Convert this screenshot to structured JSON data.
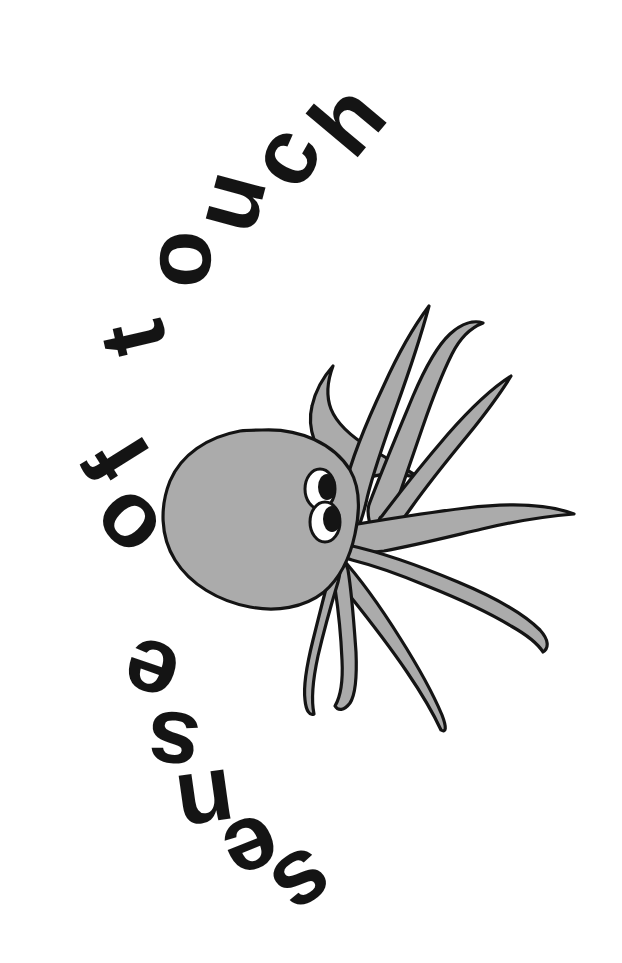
{
  "page": {
    "title": "sense of touch",
    "background_color": "#ffffff",
    "width": 622,
    "height": 963,
    "kind": "illustration-worksheet"
  },
  "curved_title": {
    "full_text": "sense of touch",
    "word_1": "sense",
    "word_2": "of",
    "word_3": "touch",
    "color": "#141414",
    "arc_direction": "counter-clockwise",
    "start_position": "bottom-right",
    "end_position": "top-right",
    "letters": [
      {
        "char": "s",
        "x": 302,
        "y": 886,
        "rotate": 146
      },
      {
        "char": "e",
        "x": 250,
        "y": 852,
        "rotate": 158
      },
      {
        "char": "n",
        "x": 203,
        "y": 805,
        "rotate": 172
      },
      {
        "char": "s",
        "x": 170,
        "y": 745,
        "rotate": 186
      },
      {
        "char": "e",
        "x": 147,
        "y": 673,
        "rotate": 199
      },
      {
        "char": "o",
        "x": 122,
        "y": 524,
        "rotate": 226
      },
      {
        "char": "f",
        "x": 116,
        "y": 457,
        "rotate": 238
      },
      {
        "char": "t",
        "x": 132,
        "y": 336,
        "rotate": 257
      },
      {
        "char": "o",
        "x": 178,
        "y": 256,
        "rotate": 272
      },
      {
        "char": "u",
        "x": 229,
        "y": 198,
        "rotate": 285
      },
      {
        "char": "c",
        "x": 285,
        "y": 153,
        "rotate": 297
      },
      {
        "char": "h",
        "x": 349,
        "y": 117,
        "rotate": 310
      }
    ]
  },
  "octopus": {
    "name": "octopus",
    "body_fill": "#ababab",
    "outline_color": "#141414",
    "outline_width": 3,
    "eye_white": "#ffffff",
    "eye_pupil": "#141414",
    "tentacle_count": 7,
    "body_center": {
      "x": 258,
      "y": 512
    },
    "eyes": [
      {
        "name": "upper-eye",
        "cx": 320,
        "cy": 489,
        "rx": 15,
        "ry": 20,
        "pupil_cx": 327,
        "pupil_cy": 487,
        "pupil_rx": 9,
        "pupil_ry": 13
      },
      {
        "name": "lower-eye",
        "cx": 325,
        "cy": 522,
        "rx": 15,
        "ry": 20,
        "pupil_cx": 332,
        "pupil_cy": 519,
        "pupil_rx": 9,
        "pupil_ry": 13
      }
    ]
  },
  "palette": {
    "ink": "#141414",
    "gray": "#ababab",
    "paper": "#ffffff"
  }
}
